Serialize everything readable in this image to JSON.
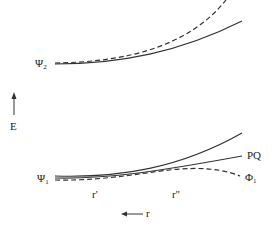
{
  "diagram": {
    "type": "potential energy curves",
    "axis": {
      "energy_label": "E",
      "coordinate_label": "r",
      "energy_arrow": "up",
      "coordinate_arrow": "left"
    },
    "labels": {
      "psi2": {
        "symbol": "Ψ",
        "subscript": "2"
      },
      "psi1": {
        "symbol": "Ψ",
        "subscript": "1"
      },
      "phi1": {
        "symbol": "Φ",
        "subscript": "1"
      },
      "pq": "PQ",
      "r_prime": "r'",
      "r_double_prime": "r''"
    },
    "curves": [
      {
        "name": "Psi2 solid",
        "style": "solid"
      },
      {
        "name": "Psi2 dashed",
        "style": "dashed"
      },
      {
        "name": "Psi1 solid upper",
        "style": "solid"
      },
      {
        "name": "PQ solid",
        "style": "solid"
      },
      {
        "name": "Phi1 dashed",
        "style": "dashed"
      }
    ],
    "colors": {
      "line": "#333333",
      "background": "#ffffff"
    }
  }
}
